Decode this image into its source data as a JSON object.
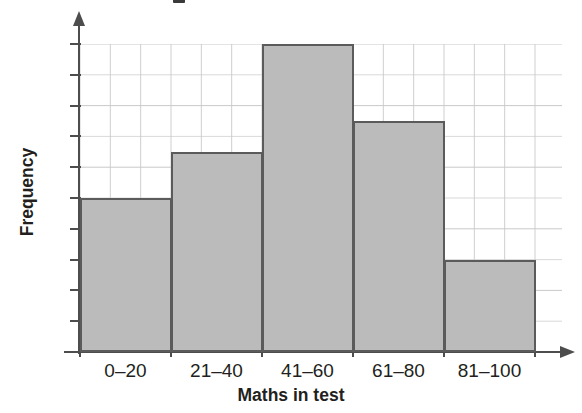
{
  "chart_data": {
    "type": "bar",
    "title": "",
    "categories": [
      "0–20",
      "21–40",
      "41–60",
      "61–80",
      "81–100"
    ],
    "values": [
      10,
      13,
      20,
      15,
      6
    ],
    "xlabel": "Maths in test",
    "ylabel": "Frequency",
    "ylim": [
      0,
      20
    ],
    "ytick_step": 2,
    "yticks": [
      "20",
      "18",
      "16",
      "14",
      "12",
      "10",
      "8",
      "6",
      "4",
      "2",
      "0"
    ],
    "ytick_values": [
      20,
      18,
      16,
      14,
      12,
      10,
      8,
      6,
      4,
      2,
      0
    ],
    "grid": true,
    "grid_color": "#c9c9c9",
    "legend": "none",
    "bar_fill_color": "#bbbbbb",
    "bar_edge_color": "#5b5b5b",
    "axis_color": "#4d4d4d",
    "text_color": "#231f20",
    "bars_touch": true,
    "grid_extends_past_bars": true
  },
  "axis": {
    "y_title": "Frequency",
    "x_title": "Maths in test"
  }
}
